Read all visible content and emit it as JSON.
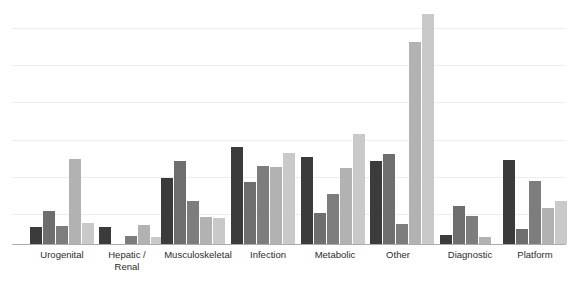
{
  "chart_data": {
    "type": "bar",
    "title": "",
    "subtitle": "",
    "xlabel": "",
    "ylabel": "",
    "ylim": [
      0,
      5
    ],
    "grid": true,
    "gridlines": [
      1,
      2,
      3,
      4
    ],
    "legend": "none",
    "axis_tick_labels": [],
    "categories": [
      "Urogenital",
      "Hepatic /\nRenal",
      "Musculoskeletal",
      "Infection",
      "Metabolic",
      "Other",
      "Diagnostic",
      "Platform"
    ],
    "series": [
      {
        "name": "Series 1",
        "color": "#3b3b3b",
        "values": [
          0.33,
          0.33,
          1.3,
          1.93,
          1.72,
          1.65,
          0.17,
          1.66
        ]
      },
      {
        "name": "Series 2",
        "color": "#6e6e6e",
        "values": [
          0.65,
          0.0,
          1.65,
          1.22,
          0.61,
          1.78,
          0.75,
          0.3
        ]
      },
      {
        "name": "Series 3",
        "color": "#7d7d7d",
        "values": [
          0.35,
          0.15,
          0.86,
          1.54,
          1.0,
          0.39,
          0.56,
          1.25
        ]
      },
      {
        "name": "Series 4",
        "color": "#b2b2b2",
        "values": [
          1.68,
          0.37,
          0.53,
          1.53,
          1.5,
          4.01,
          0.14,
          0.71
        ]
      },
      {
        "name": "Series 5",
        "color": "#c9c9c9",
        "values": [
          0.42,
          0.13,
          0.52,
          1.8,
          2.18,
          4.55,
          0.0,
          0.85
        ]
      }
    ]
  },
  "geometry": {
    "plot_top": 0,
    "baseline_y": 244,
    "y_max_value": 5.0,
    "pixels_per_unit": 50.5,
    "bar_width": 11.5,
    "bar_gap": 1.5,
    "group_starts": [
      30,
      99,
      161,
      231,
      301,
      370,
      440,
      503
    ],
    "gridline_y": [
      28,
      65,
      102,
      140,
      177,
      214
    ],
    "label_centers": [
      62,
      127,
      198,
      268,
      335,
      398,
      470,
      535
    ],
    "label_widths": [
      80,
      70,
      110,
      80,
      80,
      70,
      80,
      80
    ]
  }
}
